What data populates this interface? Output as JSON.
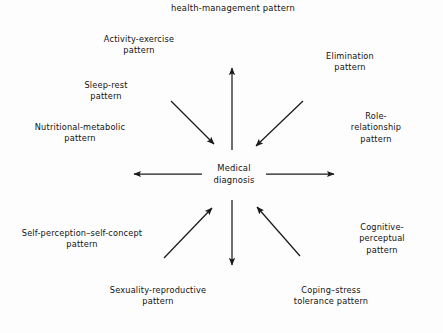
{
  "diagram": {
    "title": "health-management pattern",
    "center": "Medical\ndiagnosis",
    "stroke_color": "#1a1a1a",
    "background_color": "#fdfdfd",
    "nodes": [
      {
        "id": "activity-exercise",
        "label": "Activity-exercise\npattern",
        "direction": "inward"
      },
      {
        "id": "elimination",
        "label": "Elimination\npattern",
        "direction": "outward"
      },
      {
        "id": "sleep-rest",
        "label": "Sleep-rest\npattern",
        "direction": "inward"
      },
      {
        "id": "role-relationship",
        "label": "Role-relationship\npattern",
        "direction": "inward"
      },
      {
        "id": "nutritional-metabolic",
        "label": "Nutritional-metabolic\npattern",
        "direction": "outward"
      },
      {
        "id": "cognitive-perceptual",
        "label": "Cognitive-perceptual\npattern",
        "direction": "inward"
      },
      {
        "id": "self-perception-self-concept",
        "label": "Self-perception–self-concept\npattern",
        "direction": "outward"
      },
      {
        "id": "coping-stress-tolerance",
        "label": "Coping–stress\ntolerance pattern",
        "direction": "inward"
      },
      {
        "id": "sexuality-reproductive",
        "label": "Sexuality-reproductive\npattern",
        "direction": "outward"
      }
    ],
    "arrows": [
      {
        "id": "arrow-up",
        "points": "outward"
      },
      {
        "id": "arrow-down",
        "points": "outward"
      },
      {
        "id": "arrow-left",
        "points": "outward"
      },
      {
        "id": "arrow-right",
        "points": "outward"
      },
      {
        "id": "arrow-upper-left",
        "points": "inward"
      },
      {
        "id": "arrow-upper-right",
        "points": "inward"
      },
      {
        "id": "arrow-lower-left",
        "points": "inward"
      },
      {
        "id": "arrow-lower-right",
        "points": "inward"
      }
    ]
  }
}
